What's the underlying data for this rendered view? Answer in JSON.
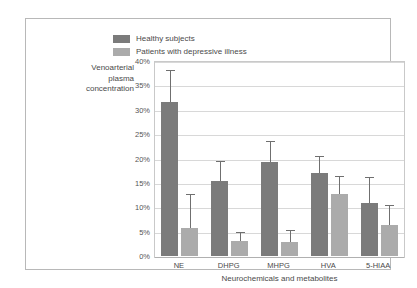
{
  "chart_data": {
    "type": "bar",
    "title": "",
    "xlabel": "Neurochemicals and metabolites",
    "ylabel": "Venoarterial plasma concentration",
    "ylabel_lines": [
      "Venoarterial",
      "plasma",
      "concentration"
    ],
    "categories": [
      "NE",
      "DHPG",
      "MHPG",
      "HVA",
      "5-HIAA"
    ],
    "ylim": [
      0,
      40
    ],
    "ytick_values": [
      0,
      5,
      10,
      15,
      20,
      25,
      30,
      35,
      40
    ],
    "ytick_labels": [
      "0%",
      "5%",
      "10%",
      "15%",
      "20%",
      "25%",
      "30%",
      "35%",
      "40%"
    ],
    "grid": true,
    "legend_position": "top-center",
    "value_suffix": "%",
    "series": [
      {
        "name": "Healthy subjects",
        "color": "#7b7b7b",
        "values": [
          31.5,
          15.3,
          19.3,
          17.0,
          10.8
        ],
        "error_upper": [
          38.0,
          19.3,
          23.4,
          20.3,
          16.0
        ]
      },
      {
        "name": "Patients with depressive illness",
        "color": "#ababab",
        "values": [
          5.7,
          3.0,
          2.8,
          12.7,
          6.3
        ],
        "error_upper": [
          12.5,
          4.8,
          5.2,
          16.3,
          10.2
        ]
      }
    ]
  },
  "legend": {
    "items": [
      {
        "label": "Healthy subjects",
        "swatch": "healthy"
      },
      {
        "label": "Patients with depressive illness",
        "swatch": "patient"
      }
    ]
  },
  "colors": {
    "healthy_bar": "#7b7b7b",
    "patient_bar": "#ababab",
    "gridline": "#d8d8d8",
    "frame": "#b8b8b8",
    "plot_border": "#c9c9c9",
    "text": "#4a4a4a"
  }
}
